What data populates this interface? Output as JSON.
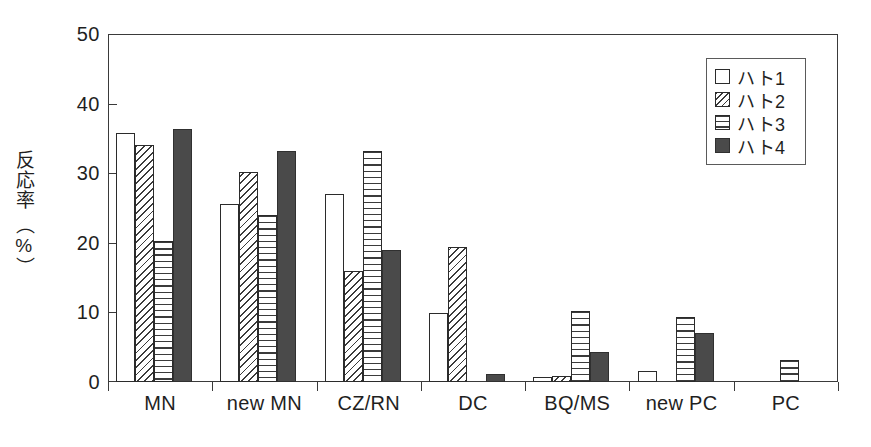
{
  "chart_data": {
    "type": "bar",
    "title": "",
    "xlabel": "",
    "ylabel": "反応率（%）",
    "ylabel_lines": [
      "反応率",
      "（%）"
    ],
    "ylim": [
      0,
      50
    ],
    "yticks": [
      0,
      10,
      20,
      30,
      40,
      50
    ],
    "ytick_labels": [
      "0",
      "10",
      "20",
      "30",
      "40",
      "50"
    ],
    "grid": false,
    "legend_position": "top-right",
    "categories": [
      "MN",
      "new MN",
      "CZ/RN",
      "DC",
      "BQ/MS",
      "new PC",
      "PC"
    ],
    "series": [
      {
        "name": "ハト1",
        "fill": "white",
        "values": [
          35.8,
          25.6,
          27.0,
          9.9,
          0.7,
          1.6,
          0.0
        ]
      },
      {
        "name": "ハト2",
        "fill": "diagonal-hatch",
        "values": [
          34.1,
          30.2,
          16.0,
          19.4,
          0.8,
          0.0,
          0.0
        ]
      },
      {
        "name": "ハト3",
        "fill": "horizontal-lines",
        "values": [
          20.2,
          24.0,
          33.2,
          0.0,
          10.2,
          9.4,
          3.2
        ]
      },
      {
        "name": "ハト4",
        "fill": "solid-dark",
        "values": [
          36.3,
          33.2,
          19.0,
          1.1,
          4.3,
          7.1,
          0.0
        ]
      }
    ]
  },
  "legend": {
    "items": [
      {
        "label": "ハト1"
      },
      {
        "label": "ハト2"
      },
      {
        "label": "ハト3"
      },
      {
        "label": "ハト4"
      }
    ]
  },
  "axis": {
    "y_title_top": "反応率",
    "y_title_bottom": "（%）"
  }
}
